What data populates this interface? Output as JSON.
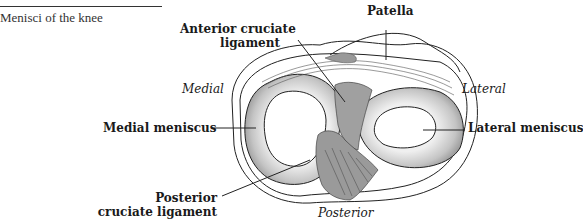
{
  "figure": {
    "caption": "Menisci of the knee"
  },
  "labels": {
    "patella": "Patella",
    "acl_line1": "Anterior cruciate",
    "acl_line2": "ligament",
    "medial": "Medial",
    "lateral": "Lateral",
    "medial_meniscus": "Medial meniscus",
    "lateral_meniscus": "Lateral meniscus",
    "pcl_line1": "Posterior",
    "pcl_line2": "cruciate ligament",
    "posterior": "Posterior"
  },
  "colors": {
    "meniscus_fill": "#b8b8b8",
    "meniscus_highlight": "#e6e6e6",
    "ligament": "#8a8a8a",
    "outline": "#222222"
  }
}
